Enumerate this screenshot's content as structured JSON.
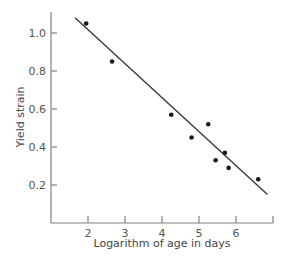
{
  "chart_data": {
    "type": "scatter",
    "title": "",
    "xlabel": "Logarithm of age in days",
    "ylabel": "Yield strain",
    "xlim": [
      1,
      7
    ],
    "ylim": [
      0,
      1.1
    ],
    "x_ticks": [
      2,
      3,
      4,
      5,
      6,
      7
    ],
    "x_tick_labels": [
      "2",
      "3",
      "4",
      "5",
      "6",
      ""
    ],
    "y_ticks": [
      0.2,
      0.4,
      0.6,
      0.8,
      1.0
    ],
    "y_tick_labels": [
      "0.2",
      "0.4",
      "0.6",
      "0.8",
      "1.0"
    ],
    "grid": false,
    "legend": null,
    "series": [
      {
        "name": "observations",
        "type": "scatter",
        "x": [
          1.95,
          2.65,
          4.25,
          4.8,
          5.25,
          5.45,
          5.7,
          5.8,
          6.6
        ],
        "y": [
          1.05,
          0.85,
          0.57,
          0.45,
          0.52,
          0.33,
          0.37,
          0.29,
          0.23
        ]
      },
      {
        "name": "fitted line",
        "type": "line",
        "x": [
          1.65,
          6.85
        ],
        "y": [
          1.08,
          0.15
        ]
      }
    ]
  }
}
